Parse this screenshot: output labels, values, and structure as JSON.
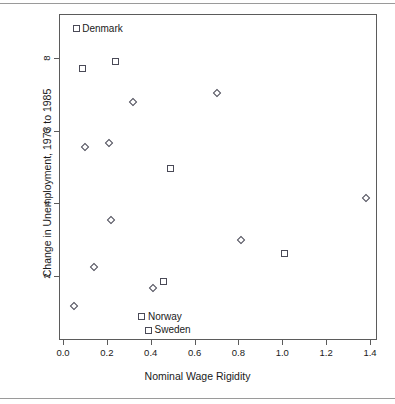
{
  "chart_data": {
    "type": "scatter",
    "title": "",
    "xlabel": "Nominal Wage Rigidity",
    "ylabel": "Change in Unemployment, 1973 to 1985",
    "xlim": [
      -0.02,
      1.45
    ],
    "ylim": [
      0.25,
      9.15
    ],
    "xticks": [
      "0.0",
      "0.2",
      "0.4",
      "0.6",
      "0.8",
      "1.0",
      "1.2",
      "1.4"
    ],
    "xtick_values": [
      0.0,
      0.2,
      0.4,
      0.6,
      0.8,
      1.0,
      1.2,
      1.4
    ],
    "yticks": [
      "2",
      "4",
      "6",
      "8"
    ],
    "ytick_values": [
      2,
      4,
      6,
      8
    ],
    "grid": false,
    "legend": "none",
    "marker_colors": {
      "outline": "#4a4a57",
      "fill": "none"
    },
    "points": [
      {
        "x": 0.06,
        "y": 8.8,
        "marker": "square",
        "label": "Denmark"
      },
      {
        "x": 0.09,
        "y": 7.7,
        "marker": "square",
        "label": ""
      },
      {
        "x": 0.24,
        "y": 7.9,
        "marker": "square",
        "label": ""
      },
      {
        "x": 0.32,
        "y": 6.8,
        "marker": "diamond",
        "label": ""
      },
      {
        "x": 0.7,
        "y": 7.05,
        "marker": "diamond",
        "label": ""
      },
      {
        "x": 0.1,
        "y": 5.55,
        "marker": "diamond",
        "label": ""
      },
      {
        "x": 0.21,
        "y": 5.65,
        "marker": "diamond",
        "label": ""
      },
      {
        "x": 0.49,
        "y": 4.95,
        "marker": "square",
        "label": ""
      },
      {
        "x": 1.38,
        "y": 4.15,
        "marker": "diamond",
        "label": ""
      },
      {
        "x": 0.22,
        "y": 3.55,
        "marker": "diamond",
        "label": ""
      },
      {
        "x": 0.81,
        "y": 2.98,
        "marker": "diamond",
        "label": ""
      },
      {
        "x": 1.01,
        "y": 2.62,
        "marker": "square",
        "label": ""
      },
      {
        "x": 0.14,
        "y": 2.25,
        "marker": "diamond",
        "label": ""
      },
      {
        "x": 0.46,
        "y": 1.85,
        "marker": "square",
        "label": ""
      },
      {
        "x": 0.41,
        "y": 1.68,
        "marker": "diamond",
        "label": ""
      },
      {
        "x": 0.05,
        "y": 1.18,
        "marker": "diamond",
        "label": ""
      },
      {
        "x": 0.36,
        "y": 0.88,
        "marker": "square",
        "label": "Norway"
      },
      {
        "x": 0.39,
        "y": 0.5,
        "marker": "square",
        "label": "Sweden"
      }
    ],
    "annotations": [
      {
        "text": "Denmark",
        "x": 0.06,
        "y": 8.8
      },
      {
        "text": "Norway",
        "x": 0.36,
        "y": 0.88
      },
      {
        "text": "Sweden",
        "x": 0.39,
        "y": 0.5
      }
    ]
  }
}
